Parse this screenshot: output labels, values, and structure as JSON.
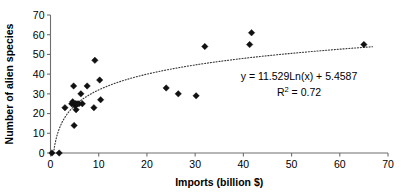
{
  "chart_data": {
    "type": "scatter",
    "title": "",
    "xlabel": "Imports (billion $)",
    "ylabel": "Number of alien species",
    "xlim": [
      0,
      70
    ],
    "ylim": [
      0,
      70
    ],
    "xticks": [
      0,
      10,
      20,
      30,
      40,
      50,
      60,
      70
    ],
    "yticks": [
      0,
      10,
      20,
      30,
      40,
      50,
      60,
      70
    ],
    "xtick_labels": [
      "0",
      "10",
      "20",
      "30",
      "40",
      "50",
      "60",
      "70"
    ],
    "ytick_labels": [
      "0",
      "10",
      "20",
      "30",
      "40",
      "50",
      "60",
      "70"
    ],
    "grid": false,
    "legend": "none",
    "marker": "diamond",
    "marker_color": "#111111",
    "points": [
      {
        "x": 0.3,
        "y": 0
      },
      {
        "x": 1.8,
        "y": 0
      },
      {
        "x": 3.0,
        "y": 23
      },
      {
        "x": 4.4,
        "y": 25
      },
      {
        "x": 4.6,
        "y": 26
      },
      {
        "x": 4.8,
        "y": 34
      },
      {
        "x": 4.9,
        "y": 14
      },
      {
        "x": 5.1,
        "y": 24
      },
      {
        "x": 5.2,
        "y": 25
      },
      {
        "x": 5.3,
        "y": 22
      },
      {
        "x": 5.5,
        "y": 25
      },
      {
        "x": 5.9,
        "y": 25
      },
      {
        "x": 6.3,
        "y": 30
      },
      {
        "x": 6.6,
        "y": 25
      },
      {
        "x": 7.6,
        "y": 34
      },
      {
        "x": 9.0,
        "y": 23
      },
      {
        "x": 9.2,
        "y": 47
      },
      {
        "x": 10.2,
        "y": 37
      },
      {
        "x": 10.4,
        "y": 27
      },
      {
        "x": 24.0,
        "y": 33
      },
      {
        "x": 26.5,
        "y": 30
      },
      {
        "x": 30.2,
        "y": 29
      },
      {
        "x": 32.0,
        "y": 54
      },
      {
        "x": 41.3,
        "y": 55
      },
      {
        "x": 41.7,
        "y": 61
      },
      {
        "x": 65.0,
        "y": 55
      }
    ],
    "trendline": {
      "type": "logarithmic",
      "style": "dotted",
      "color": "#3a3a3a",
      "coefficient": 11.529,
      "intercept": 5.4587,
      "r_squared": 0.72,
      "equation_label": "y = 11.529Ln(x) + 5.4587",
      "r2_label_prefix": "R",
      "r2_label_exponent": "2",
      "r2_label_value": " = 0.72"
    }
  }
}
